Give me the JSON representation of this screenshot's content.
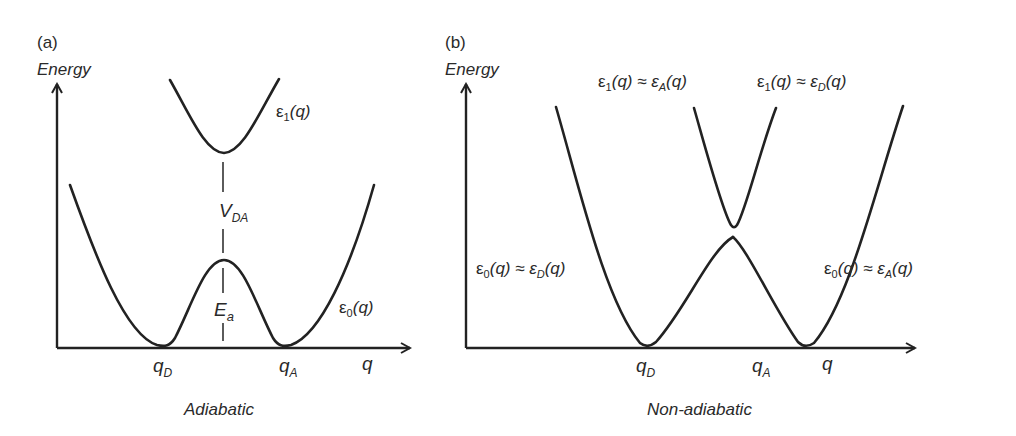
{
  "panels": [
    {
      "id": "a",
      "panel_label": "(a)",
      "y_axis_label": "Energy",
      "x_axis_label": "q",
      "x_ticks": [
        "qD",
        "qA"
      ],
      "curves": [
        "ε1(q)",
        "ε0(q)"
      ],
      "annotations": [
        "V_DA",
        "E_a"
      ],
      "caption": "Adiabatic"
    },
    {
      "id": "b",
      "panel_label": "(b)",
      "y_axis_label": "Energy",
      "x_axis_label": "q",
      "x_ticks": [
        "qD",
        "qA"
      ],
      "curves": [
        "ε1(q) ≈ εA(q)",
        "ε1(q) ≈ εD(q)",
        "ε0(q) ≈ εD(q)",
        "ε0(q) ≈ εA(q)"
      ],
      "caption": "Non-adiabatic"
    }
  ],
  "text": {
    "a_label": "(a)",
    "a_energy": "Energy",
    "a_eps1_base": "ε",
    "a_eps1_sub": "1",
    "a_eps1_arg": "(q)",
    "a_eps0_base": "ε",
    "a_eps0_sub": "0",
    "a_eps0_arg": "(q)",
    "a_vda_base": "V",
    "a_vda_sub": "DA",
    "a_ea_base": "E",
    "a_ea_sub": "a",
    "a_qd_base": "q",
    "a_qd_sub": "D",
    "a_qa_base": "q",
    "a_qa_sub": "A",
    "a_q": "q",
    "a_caption": "Adiabatic",
    "b_label": "(b)",
    "b_energy": "Energy",
    "b_top_left": {
      "e": "ε",
      "s1": "1",
      "m": "(q) ≈ ε",
      "s2": "A",
      "t": "(q)"
    },
    "b_top_right": {
      "e": "ε",
      "s1": "1",
      "m": "(q) ≈ ε",
      "s2": "D",
      "t": "(q)"
    },
    "b_mid_left": {
      "e": "ε",
      "s1": "0",
      "m": "(q) ≈ ε",
      "s2": "D",
      "t": "(q)"
    },
    "b_mid_right": {
      "e": "ε",
      "s1": "0",
      "m": "(q) ≈ ε",
      "s2": "A",
      "t": "(q)"
    },
    "b_qd_base": "q",
    "b_qd_sub": "D",
    "b_qa_base": "q",
    "b_qa_sub": "A",
    "b_q": "q",
    "b_caption": "Non-adiabatic"
  }
}
